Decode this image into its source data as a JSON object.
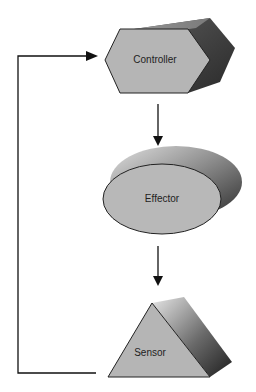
{
  "diagram": {
    "type": "feedback-loop",
    "nodes": [
      {
        "id": "controller",
        "label": "Controller",
        "shape": "hexagonal-prism"
      },
      {
        "id": "effector",
        "label": "Effector",
        "shape": "ellipse-cylinder"
      },
      {
        "id": "sensor",
        "label": "Sensor",
        "shape": "triangular-prism"
      }
    ],
    "edges": [
      {
        "from": "controller",
        "to": "effector"
      },
      {
        "from": "effector",
        "to": "sensor"
      },
      {
        "from": "sensor",
        "to": "controller",
        "style": "feedback"
      }
    ],
    "colors": {
      "face": "#b8b8b8",
      "side_dark": "#3a3a3a",
      "side_light": "#d8d8d8",
      "line": "#111111"
    }
  }
}
